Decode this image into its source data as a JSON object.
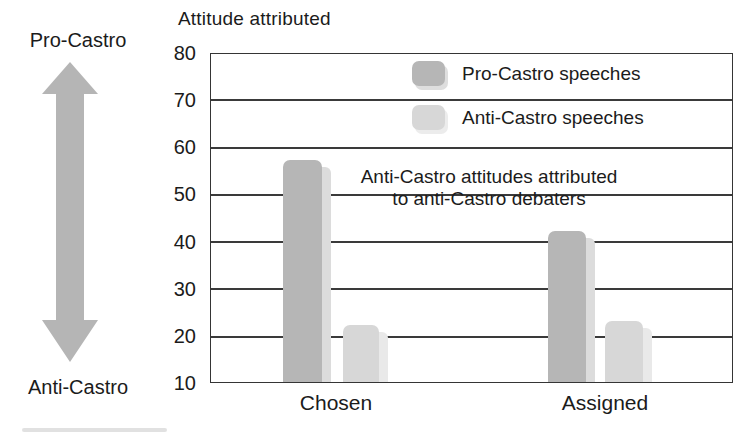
{
  "title": "Attitude attributed",
  "side_scale": {
    "top_label": "Pro-Castro",
    "bottom_label": "Anti-Castro",
    "arrow_color": "#b5b5b5"
  },
  "legend": {
    "items": [
      {
        "label": "Pro-Castro speeches",
        "swatch_color": "#b6b6b6",
        "swatch_shadow": "#dedede"
      },
      {
        "label": "Anti-Castro speeches",
        "swatch_color": "#d7d7d7",
        "swatch_shadow": "#ececec"
      }
    ]
  },
  "annotation": {
    "line1": "Anti-Castro attitudes attributed",
    "line2": "to anti-Castro debaters"
  },
  "colors": {
    "grid": "#3a3a3a",
    "text": "#1b1b1b",
    "arrow_lines": "#1a1a1a"
  },
  "chart_data": {
    "type": "bar",
    "title": "Attitude attributed",
    "categories": [
      "Chosen",
      "Assigned"
    ],
    "series": [
      {
        "name": "Pro-Castro speeches",
        "values": [
          57,
          42
        ],
        "color": "#b6b6b6",
        "shadow": "#dcdcdc"
      },
      {
        "name": "Anti-Castro speeches",
        "values": [
          22,
          23
        ],
        "color": "#d7d7d7",
        "shadow": "#e9e9e9"
      }
    ],
    "xlabel": "",
    "ylabel": "Attitude attributed",
    "ylim": [
      10,
      80
    ],
    "yticks": [
      80,
      70,
      60,
      50,
      40,
      30,
      20,
      10
    ],
    "grid": true,
    "legend_position": "top-right",
    "annotation_text": "Anti-Castro attitudes attributed to anti-Castro debaters"
  }
}
